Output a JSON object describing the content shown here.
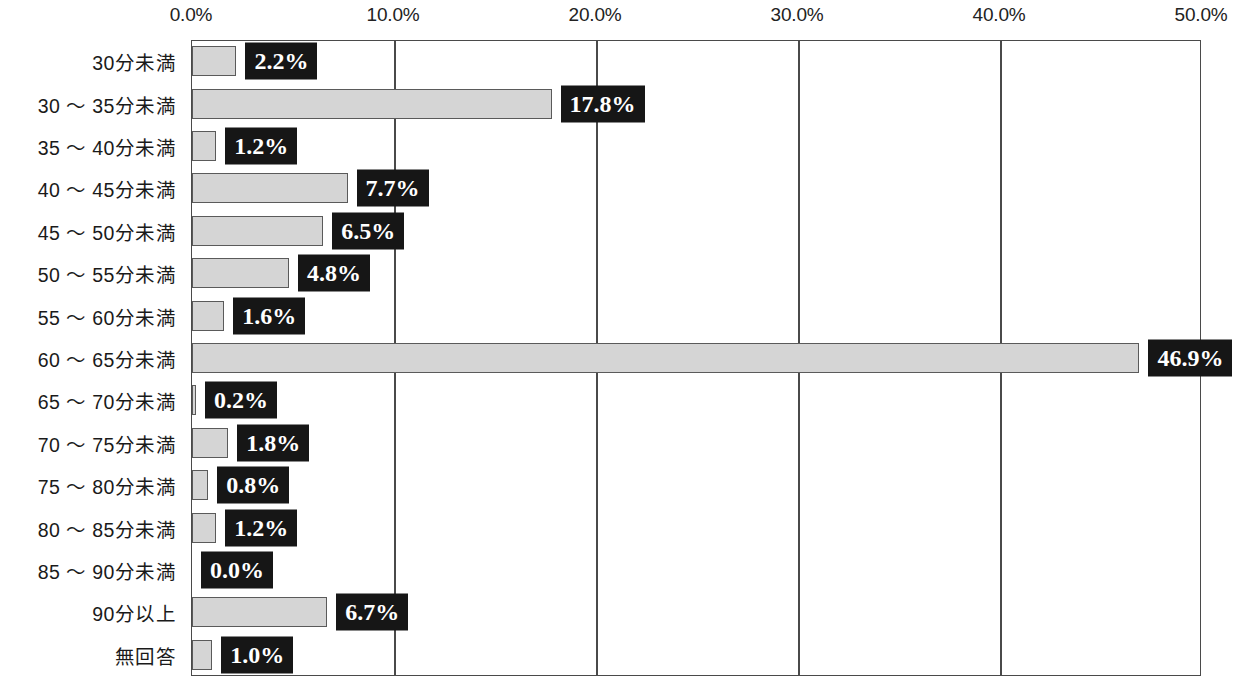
{
  "chart_data": {
    "type": "bar",
    "orientation": "horizontal",
    "title": "",
    "subtitle": "",
    "xlabel": "",
    "ylabel": "",
    "xlim": [
      0,
      50
    ],
    "grid": true,
    "legend": false,
    "axis_ticks": [
      "0.0%",
      "10.0%",
      "20.0%",
      "30.0%",
      "40.0%",
      "50.0%"
    ],
    "axis_tick_values": [
      0,
      10,
      20,
      30,
      40,
      50
    ],
    "categories": [
      "30分未満",
      "30 〜 35分未満",
      "35 〜 40分未満",
      "40 〜 45分未満",
      "45 〜 50分未満",
      "50 〜 55分未満",
      "55 〜 60分未満",
      "60 〜 65分未満",
      "65 〜 70分未満",
      "70 〜 75分未満",
      "75 〜 80分未満",
      "80 〜 85分未満",
      "85 〜 90分未満",
      "90分以上",
      "無回答"
    ],
    "values": [
      2.2,
      17.8,
      1.2,
      7.7,
      6.5,
      4.8,
      1.6,
      46.9,
      0.2,
      1.8,
      0.8,
      1.2,
      0.0,
      6.7,
      1.0
    ],
    "value_labels": [
      "2.2%",
      "17.8%",
      "1.2%",
      "7.7%",
      "6.5%",
      "4.8%",
      "1.6%",
      "46.9%",
      "0.2%",
      "1.8%",
      "0.8%",
      "1.2%",
      "0.0%",
      "6.7%",
      "1.0%"
    ],
    "colors": {
      "bar_fill": "#d5d5d5",
      "bar_border": "#5a5a5a",
      "label_box_bg": "#161616",
      "label_box_text": "#ffffff",
      "axis": "#4a4a4a",
      "background": "#ffffff"
    }
  }
}
